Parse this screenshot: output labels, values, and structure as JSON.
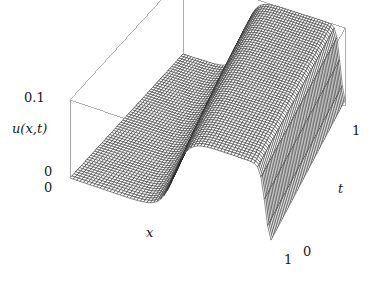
{
  "figure": {
    "kind": "3d-surface-plot",
    "background_color": "#ffffff",
    "line_color": "#2a2a2a",
    "box_color": "#9a9a9a",
    "surface_fill": "#6e6e6e"
  },
  "chart_data": {
    "type": "surface",
    "title": "",
    "xlabel": "x",
    "ylabel": "t",
    "zlabel": "u(x,t)",
    "xlim": [
      0,
      1
    ],
    "ylim": [
      0,
      1
    ],
    "zlim": [
      0,
      0.1
    ],
    "x_ticks": [
      0,
      1
    ],
    "x_tick_labels": [
      "0",
      "1"
    ],
    "y_ticks": [
      0,
      1
    ],
    "y_tick_labels": [
      "0",
      "1"
    ],
    "z_ticks": [
      0,
      0.1
    ],
    "z_tick_labels": [
      "0",
      "0.1"
    ],
    "grid": false,
    "legend": null,
    "mesh": {
      "nx": 60,
      "nt": 60,
      "wireframe": true
    },
    "surface_model": {
      "plateau_value": 0.1,
      "front_center_at_t0": 0.52,
      "front_center_at_t1": 0.38,
      "front_width": 0.035,
      "right_edge_center": 0.97,
      "right_edge_width": 0.012
    },
    "view": {
      "azimuth_deg": 38,
      "elevation_deg": 22,
      "projection": "orthographic"
    },
    "axis_labels": {
      "z_max": "0.1",
      "z_min": "0",
      "z_name": "u(x,t)",
      "x_min": "0",
      "x_max": "1",
      "x_name": "x",
      "t_min": "0",
      "t_max": "1",
      "t_name": "t"
    }
  }
}
